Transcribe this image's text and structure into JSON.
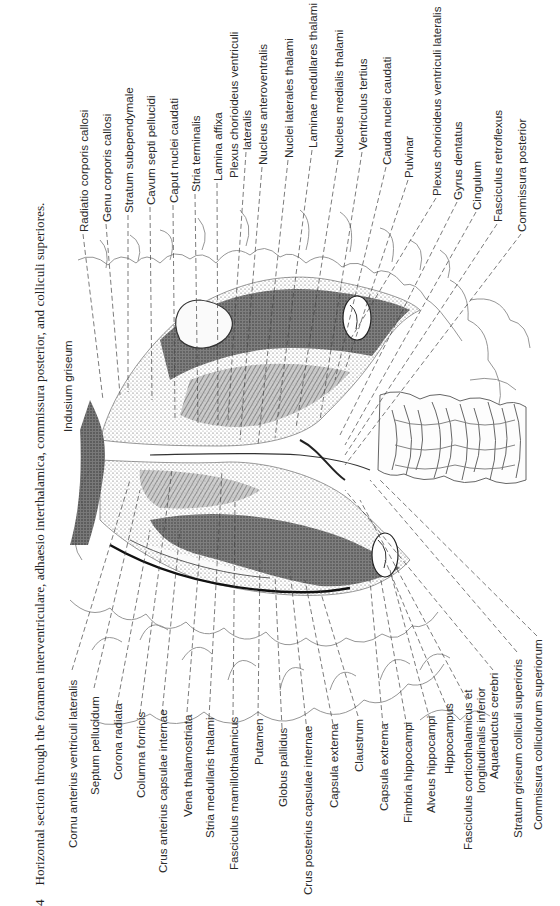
{
  "figure": {
    "number": "4",
    "caption": "Horizontal section through the foramen interventriculare, adhaesio interthalamica, commissura posterior, and colliculi superiores."
  },
  "labels_top": [
    {
      "text": "Radiatio corporis callosi",
      "x": 83,
      "y": 232
    },
    {
      "text": "Genu corporis callosi",
      "x": 106,
      "y": 222
    },
    {
      "text": "Stratum subependymale",
      "x": 128,
      "y": 213
    },
    {
      "text": "Cavum septi pellucidi",
      "x": 150,
      "y": 205
    },
    {
      "text": "Caput nuclei caudati",
      "x": 173,
      "y": 203
    },
    {
      "text": "Stria terminalis",
      "x": 195,
      "y": 192
    },
    {
      "text": "Lamina affixa",
      "x": 217,
      "y": 181
    },
    {
      "text": "Plexus chorioideus ventriculi",
      "x": 233,
      "y": 178
    },
    {
      "text": "lateralis",
      "x": 246,
      "y": 150
    },
    {
      "text": "Nucleus anteroventralis",
      "x": 262,
      "y": 165
    },
    {
      "text": "Nuclei laterales thalami",
      "x": 288,
      "y": 158
    },
    {
      "text": "Laminae medullares thalami",
      "x": 312,
      "y": 148
    },
    {
      "text": "Nucleus medialis thalami",
      "x": 338,
      "y": 158
    },
    {
      "text": "Ventriculus tertius",
      "x": 362,
      "y": 150
    },
    {
      "text": "Cauda nuclei caudati",
      "x": 386,
      "y": 165
    },
    {
      "text": "Pulvinar",
      "x": 408,
      "y": 178
    },
    {
      "text": "Plexus chorioideus ventriculi lateralis",
      "x": 436,
      "y": 196
    },
    {
      "text": "Gyrus dentatus",
      "x": 457,
      "y": 200
    },
    {
      "text": "Cingulum",
      "x": 476,
      "y": 210
    },
    {
      "text": "Fasciculus retroflexus",
      "x": 497,
      "y": 222
    },
    {
      "text": "Commissura posterior",
      "x": 521,
      "y": 232
    }
  ],
  "labels_bottom": [
    {
      "text": "Cornu anterius ventriculi lateralis",
      "x": 72,
      "y": 848
    },
    {
      "text": "Septum pellucidum",
      "x": 94,
      "y": 795
    },
    {
      "text": "Corona radiata",
      "x": 117,
      "y": 780
    },
    {
      "text": "Columna fornicis",
      "x": 140,
      "y": 798
    },
    {
      "text": "Crus anterius capsulae internae",
      "x": 162,
      "y": 873
    },
    {
      "text": "Vena thalamostriata",
      "x": 187,
      "y": 817
    },
    {
      "text": "Stria medullaris thalami",
      "x": 209,
      "y": 838
    },
    {
      "text": "Fasciculus mamillothalamicus",
      "x": 233,
      "y": 870
    },
    {
      "text": "Putamen",
      "x": 258,
      "y": 765
    },
    {
      "text": "Globus pallidus",
      "x": 282,
      "y": 807
    },
    {
      "text": "Crus posterius capsulae internae",
      "x": 307,
      "y": 895
    },
    {
      "text": "Capsula externa",
      "x": 333,
      "y": 808
    },
    {
      "text": "Claustrum",
      "x": 358,
      "y": 772
    },
    {
      "text": "Capsula extrema",
      "x": 383,
      "y": 811
    },
    {
      "text": "Fimbria hippocampi",
      "x": 407,
      "y": 823
    },
    {
      "text": "Alveus hippocampi",
      "x": 430,
      "y": 813
    },
    {
      "text": "Hippocampus",
      "x": 448,
      "y": 774
    },
    {
      "text": "Fasciculus corticothalamicus et",
      "x": 467,
      "y": 850
    },
    {
      "text": "longitudinalis inferior",
      "x": 480,
      "y": 793
    },
    {
      "text": "Aquaeductus cerebri",
      "x": 493,
      "y": 779
    },
    {
      "text": "Stratum griseum colliculi superioris",
      "x": 517,
      "y": 838
    },
    {
      "text": "Commissura colliculorum superiorum",
      "x": 537,
      "y": 830
    }
  ],
  "labels_inner": [
    {
      "text": "Indusium griseum",
      "x": 67,
      "y": 432
    }
  ]
}
